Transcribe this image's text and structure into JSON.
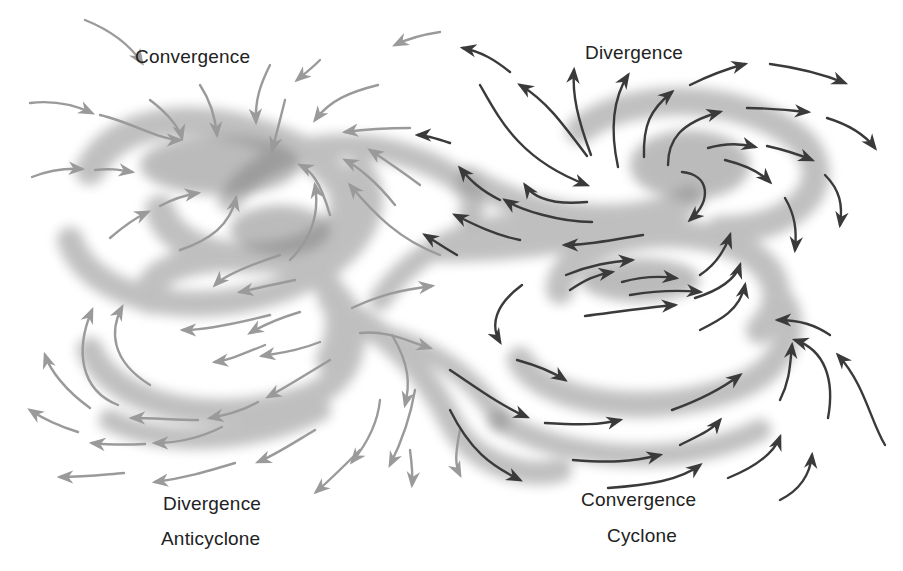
{
  "diagram": {
    "labels": {
      "top_left": "Convergence",
      "top_right": "Divergence",
      "bottom_left_line1": "Divergence",
      "bottom_left_line2": "Anticyclone",
      "bottom_right_line1": "Convergence",
      "bottom_right_line2": "Cyclone"
    },
    "systems": [
      {
        "name": "Anticyclone",
        "upper_flow": "Convergence",
        "surface_flow": "Divergence",
        "arrow_color": "#9a9a9a",
        "rotation": "clockwise (outward spiral at surface)"
      },
      {
        "name": "Cyclone",
        "upper_flow": "Divergence",
        "surface_flow": "Convergence",
        "arrow_color": "#3a3a3a",
        "rotation": "counterclockwise (inward spiral at surface)"
      }
    ],
    "colors": {
      "background": "#ffffff",
      "swirl_shading": "#8c8c8c",
      "anticyclone_arrows": "#9a9a9a",
      "cyclone_arrows": "#3a3a3a",
      "text": "#222222"
    }
  }
}
